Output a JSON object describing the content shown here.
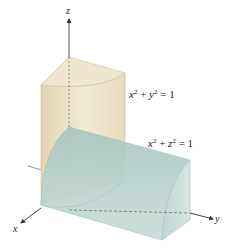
{
  "figure": {
    "axes": {
      "x_label": "x",
      "y_label": "y",
      "z_label": "z"
    },
    "surfaces": [
      {
        "name": "vertical-cylinder",
        "equation_parts": {
          "a": "x",
          "a_exp": "2",
          "op": "+",
          "b": "y",
          "b_exp": "2",
          "eq": "=",
          "rhs": "1"
        },
        "color": "#e6dcc0"
      },
      {
        "name": "horizontal-cylinder",
        "equation_parts": {
          "a": "x",
          "a_exp": "2",
          "op": "+",
          "b": "z",
          "b_exp": "2",
          "eq": "=",
          "rhs": "1"
        },
        "color": "#bcd3cf"
      }
    ],
    "colors": {
      "tan": "#e9dfc4",
      "tan_dark": "#d9caa3",
      "teal": "#b7d0cc",
      "teal_dark": "#9fbfba",
      "axis": "#444444"
    }
  }
}
